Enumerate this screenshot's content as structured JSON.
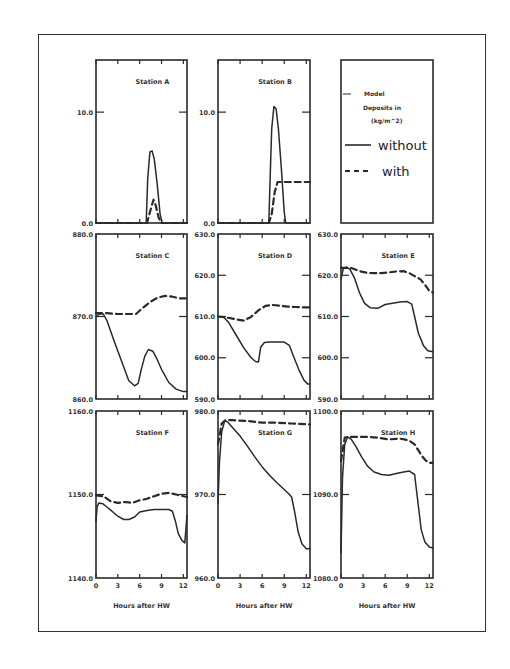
{
  "chart_data": {
    "type": "line",
    "xlabel": "Hours after HW",
    "x_ticks": [
      0,
      3,
      6,
      9,
      12
    ],
    "x_range": [
      0,
      12.5
    ],
    "legend": {
      "title_lines": [
        "Model",
        "Deposits in",
        "(kg/m^2)"
      ],
      "entries": [
        {
          "label": "without",
          "style": "solid"
        },
        {
          "label": "with",
          "style": "dashed"
        }
      ]
    },
    "panels": [
      {
        "id": "A",
        "title": "Station A",
        "col": 0,
        "row": 0,
        "ylim": [
          0,
          14.7
        ],
        "y_ticks": [
          0.0,
          10.0
        ],
        "y_tick_labels": [
          "0.0",
          "10.0"
        ],
        "series": [
          {
            "name": "without",
            "style": "solid",
            "x": [
              0,
              6.9,
              7.1,
              7.4,
              7.7,
              8.0,
              8.4,
              8.8,
              9.1,
              12.5
            ],
            "y": [
              0,
              0,
              4.0,
              6.4,
              6.5,
              5.8,
              3.5,
              0.8,
              0,
              0
            ]
          },
          {
            "name": "with",
            "style": "dashed",
            "x": [
              0,
              7.0,
              7.5,
              7.9,
              8.2,
              8.6,
              9.0,
              12.5
            ],
            "y": [
              0,
              0,
              1.2,
              2.1,
              1.6,
              0.5,
              0,
              0
            ]
          }
        ]
      },
      {
        "id": "B",
        "title": "Station B",
        "col": 1,
        "row": 0,
        "ylim": [
          0,
          14.7
        ],
        "y_ticks": [
          0.0,
          10.0
        ],
        "y_tick_labels": [
          "0.0",
          "10.0"
        ],
        "series": [
          {
            "name": "without",
            "style": "solid",
            "x": [
              0,
              6.9,
              7.1,
              7.3,
              7.6,
              7.9,
              8.2,
              8.6,
              9.0,
              9.2,
              12.5
            ],
            "y": [
              0,
              0,
              4.5,
              8.5,
              10.5,
              10.3,
              8.5,
              5.0,
              1.0,
              0,
              0
            ]
          },
          {
            "name": "with",
            "style": "dashed",
            "x": [
              0,
              6.9,
              7.3,
              7.7,
              8.1,
              9.0,
              12.5
            ],
            "y": [
              0,
              0,
              0.8,
              2.8,
              3.7,
              3.7,
              3.7
            ]
          }
        ]
      },
      {
        "id": "C",
        "title": "Station C",
        "col": 0,
        "row": 1,
        "ylim": [
          860,
          880
        ],
        "y_ticks": [
          860.0,
          870.0,
          880.0
        ],
        "y_tick_labels": [
          "860.0",
          "870.0",
          "880.0"
        ],
        "series": [
          {
            "name": "without",
            "style": "solid",
            "x": [
              0,
              0.5,
              1.0,
              1.5,
              2.5,
              3.5,
              4.5,
              5.3,
              5.8,
              6.2,
              6.7,
              7.2,
              7.8,
              8.3,
              9.0,
              10.0,
              11.0,
              12.0,
              12.5
            ],
            "y": [
              870.0,
              870.3,
              870.3,
              869.5,
              867.0,
              864.6,
              862.2,
              861.6,
              861.9,
              863.5,
              865.2,
              866.0,
              865.8,
              865.0,
              863.6,
              862.0,
              861.2,
              860.9,
              860.9
            ]
          },
          {
            "name": "with",
            "style": "dashed",
            "x": [
              0,
              1.5,
              3.0,
              4.5,
              5.5,
              6.5,
              7.5,
              8.5,
              9.5,
              10.5,
              11.5,
              12.5
            ],
            "y": [
              870.4,
              870.4,
              870.3,
              870.3,
              870.3,
              871.1,
              871.8,
              872.3,
              872.5,
              872.4,
              872.2,
              872.2
            ]
          }
        ]
      },
      {
        "id": "D",
        "title": "Station D",
        "col": 1,
        "row": 1,
        "ylim": [
          590,
          630
        ],
        "y_ticks": [
          590.0,
          600.0,
          610.0,
          620.0,
          630.0
        ],
        "y_tick_labels": [
          "590.0",
          "600.0",
          "610.0",
          "620.0",
          "630.0"
        ],
        "series": [
          {
            "name": "without",
            "style": "solid",
            "x": [
              0,
              0.8,
              1.5,
              2.5,
              3.5,
              4.5,
              5.1,
              5.5,
              5.8,
              6.3,
              7.0,
              8.0,
              9.0,
              9.7,
              10.3,
              11.0,
              11.7,
              12.2,
              12.5
            ],
            "y": [
              610.0,
              609.8,
              608.4,
              605.4,
              602.4,
              600.0,
              599.1,
              599.0,
              602.6,
              603.7,
              603.8,
              603.8,
              603.8,
              603.0,
              600.2,
              597.0,
              594.5,
              593.6,
              593.6
            ]
          },
          {
            "name": "with",
            "style": "dashed",
            "x": [
              0,
              1.0,
              2.5,
              3.5,
              4.5,
              5.5,
              6.5,
              7.5,
              8.5,
              9.5,
              10.5,
              11.5,
              12.5
            ],
            "y": [
              610.0,
              609.8,
              609.3,
              609.0,
              609.9,
              611.5,
              612.6,
              612.8,
              612.6,
              612.4,
              612.3,
              612.2,
              612.2
            ]
          }
        ]
      },
      {
        "id": "E",
        "title": "Station E",
        "col": 2,
        "row": 1,
        "ylim": [
          590,
          630
        ],
        "y_ticks": [
          590.0,
          600.0,
          610.0,
          620.0,
          630.0
        ],
        "y_tick_labels": [
          "590.0",
          "600.0",
          "610.0",
          "620.0",
          "630.0"
        ],
        "series": [
          {
            "name": "without",
            "style": "solid",
            "x": [
              0,
              0.3,
              0.7,
              1.2,
              1.8,
              2.5,
              3.2,
              4.0,
              5.0,
              6.0,
              7.0,
              8.0,
              9.0,
              9.6,
              10.0,
              10.5,
              11.2,
              11.8,
              12.3,
              12.5
            ],
            "y": [
              619.0,
              621.5,
              622.0,
              621.5,
              619.5,
              615.8,
              613.2,
              612.1,
              612.0,
              612.9,
              613.2,
              613.5,
              613.6,
              613.0,
              610.0,
              606.0,
              603.0,
              601.7,
              601.5,
              601.5
            ]
          },
          {
            "name": "with",
            "style": "dashed",
            "x": [
              0,
              0.5,
              1.5,
              2.5,
              3.5,
              4.5,
              5.5,
              6.5,
              7.5,
              8.5,
              9.3,
              10.0,
              10.8,
              11.5,
              12.0,
              12.5
            ],
            "y": [
              621.8,
              621.8,
              621.7,
              621.0,
              620.6,
              620.5,
              620.5,
              620.7,
              620.9,
              621.0,
              620.5,
              619.8,
              619.0,
              617.5,
              616.2,
              615.8
            ]
          }
        ]
      },
      {
        "id": "F",
        "title": "Station F",
        "col": 0,
        "row": 2,
        "ylim": [
          1140,
          1160
        ],
        "y_ticks": [
          1140.0,
          1150.0,
          1160.0
        ],
        "y_tick_labels": [
          "1140.0",
          "1150.0",
          "1160.0"
        ],
        "series": [
          {
            "name": "without",
            "style": "solid",
            "x": [
              0,
              0.15,
              0.4,
              0.9,
              1.5,
              2.2,
              3.0,
              3.8,
              4.5,
              5.3,
              6.0,
              7.0,
              8.0,
              9.0,
              10.0,
              10.5,
              10.9,
              11.3,
              11.8,
              12.2,
              12.5
            ],
            "y": [
              1146.8,
              1148.5,
              1149.0,
              1148.9,
              1148.5,
              1148.0,
              1147.4,
              1147.0,
              1147.0,
              1147.3,
              1147.9,
              1148.1,
              1148.2,
              1148.2,
              1148.2,
              1148.0,
              1146.8,
              1145.3,
              1144.5,
              1144.2,
              1147.5
            ]
          },
          {
            "name": "with",
            "style": "dashed",
            "x": [
              0,
              1.0,
              2.0,
              3.0,
              4.0,
              5.0,
              6.0,
              7.0,
              8.0,
              9.0,
              10.0,
              11.0,
              12.0,
              12.5
            ],
            "y": [
              1149.9,
              1149.8,
              1149.2,
              1149.0,
              1149.1,
              1149.0,
              1149.3,
              1149.5,
              1149.8,
              1150.1,
              1150.2,
              1150.0,
              1149.8,
              1149.7
            ]
          }
        ]
      },
      {
        "id": "G",
        "title": "Station G",
        "col": 1,
        "row": 2,
        "ylim": [
          960,
          980
        ],
        "y_ticks": [
          960.0,
          970.0,
          980.0
        ],
        "y_tick_labels": [
          "960.0",
          "970.0",
          "980.0"
        ],
        "series": [
          {
            "name": "without",
            "style": "solid",
            "x": [
              0,
              0.2,
              0.5,
              0.9,
              1.3,
              2.0,
              3.0,
              4.0,
              5.0,
              6.0,
              7.0,
              8.0,
              9.0,
              9.6,
              10.0,
              10.4,
              10.9,
              11.4,
              12.0,
              12.5
            ],
            "y": [
              969.0,
              974.0,
              977.5,
              978.8,
              978.7,
              978.0,
              977.0,
              975.8,
              974.5,
              973.3,
              972.3,
              971.4,
              970.6,
              970.1,
              969.7,
              968.0,
              965.5,
              964.1,
              963.5,
              963.5
            ]
          },
          {
            "name": "with",
            "style": "dashed",
            "x": [
              0,
              0.5,
              1.0,
              2.0,
              4.0,
              6.0,
              8.0,
              10.0,
              12.5
            ],
            "y": [
              976.0,
              978.5,
              978.9,
              978.9,
              978.8,
              978.6,
              978.6,
              978.5,
              978.4
            ]
          }
        ]
      },
      {
        "id": "H",
        "title": "Station H",
        "col": 2,
        "row": 2,
        "ylim": [
          1080,
          1100
        ],
        "y_ticks": [
          1080.0,
          1090.0,
          1100.0
        ],
        "y_tick_labels": [
          "1080.0",
          "1090.0",
          "1100.0"
        ],
        "series": [
          {
            "name": "without",
            "style": "solid",
            "x": [
              0,
              0.2,
              0.5,
              0.9,
              1.4,
              2.0,
              2.8,
              3.6,
              4.5,
              5.5,
              6.5,
              7.5,
              8.5,
              9.3,
              10.0,
              10.4,
              10.9,
              11.4,
              12.0,
              12.5
            ],
            "y": [
              1083.0,
              1092.0,
              1096.0,
              1096.9,
              1096.6,
              1095.8,
              1094.5,
              1093.4,
              1092.7,
              1092.4,
              1092.3,
              1092.5,
              1092.7,
              1092.8,
              1092.4,
              1089.5,
              1085.8,
              1084.3,
              1083.7,
              1083.6
            ]
          },
          {
            "name": "with",
            "style": "dashed",
            "x": [
              0,
              0.5,
              1.0,
              2.0,
              3.5,
              5.0,
              6.5,
              8.0,
              9.2,
              10.0,
              10.5,
              11.0,
              11.5,
              12.0,
              12.5
            ],
            "y": [
              1094.0,
              1096.8,
              1096.9,
              1096.9,
              1096.9,
              1096.8,
              1096.6,
              1096.7,
              1096.5,
              1096.0,
              1095.3,
              1094.6,
              1094.1,
              1093.8,
              1093.8
            ]
          }
        ]
      }
    ],
    "layout": {
      "col_x": [
        [
          96,
          187
        ],
        [
          218,
          310
        ],
        [
          341,
          433
        ]
      ],
      "row_y": [
        [
          60,
          223
        ],
        [
          234,
          399
        ],
        [
          411,
          578
        ]
      ],
      "legend_panel": {
        "col": 2,
        "row": 0
      },
      "grid": false
    }
  }
}
